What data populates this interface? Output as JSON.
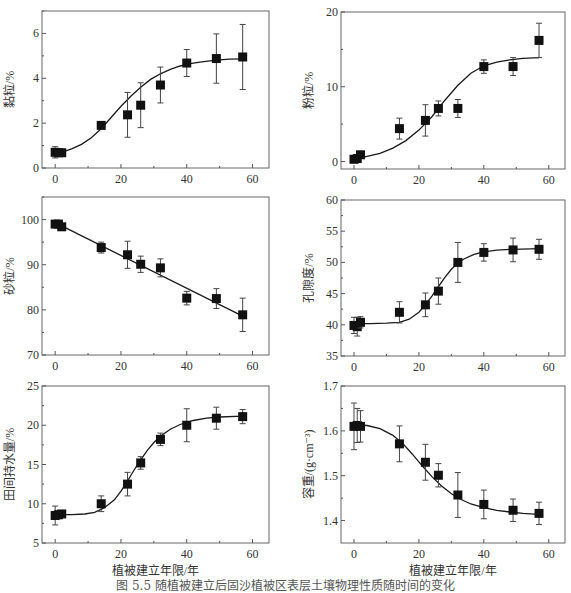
{
  "figure": {
    "caption": "图 5.5  随植被建立后固沙植被区表层土壤物理性质随时间的变化",
    "xlabel": "植被建立年限/年"
  },
  "chart_data": [
    {
      "id": "clay",
      "type": "scatter",
      "title": "",
      "xlabel": "",
      "ylabel": "黏粒/%",
      "xlim": [
        -4,
        65
      ],
      "ylim": [
        0,
        7
      ],
      "xticks": [
        0,
        20,
        40,
        60
      ],
      "yticks": [
        0,
        2,
        4,
        6
      ],
      "x": [
        0,
        1,
        2,
        14,
        22,
        26,
        32,
        40,
        49,
        57
      ],
      "y": [
        0.7,
        0.68,
        0.68,
        1.9,
        2.37,
        2.8,
        3.7,
        4.68,
        4.88,
        4.95
      ],
      "err": [
        0.25,
        0.15,
        0.1,
        0.05,
        1.0,
        1.0,
        0.8,
        0.6,
        1.1,
        1.45
      ],
      "fit": {
        "type": "sigmoid",
        "x": [
          2,
          5,
          8,
          11,
          14,
          17,
          20,
          23,
          26,
          29,
          32,
          35,
          38,
          41,
          44,
          47,
          50,
          53,
          57
        ],
        "y": [
          0.7,
          0.85,
          1.05,
          1.35,
          1.75,
          2.25,
          2.75,
          3.2,
          3.6,
          3.95,
          4.2,
          4.4,
          4.55,
          4.65,
          4.72,
          4.78,
          4.82,
          4.85,
          4.87
        ]
      },
      "box": {
        "left": 42,
        "top": 11,
        "right": 269,
        "bottom": 168
      }
    },
    {
      "id": "silt",
      "type": "scatter",
      "title": "",
      "xlabel": "",
      "ylabel": "粉粒/%",
      "xlim": [
        -4,
        65
      ],
      "ylim": [
        -1,
        20
      ],
      "xticks": [
        0,
        20,
        40,
        60
      ],
      "yticks": [
        0,
        10,
        20
      ],
      "x": [
        0,
        1,
        2,
        14,
        22,
        26,
        32,
        40,
        49,
        57
      ],
      "y": [
        0.3,
        0.4,
        0.9,
        4.4,
        5.5,
        7.1,
        7.1,
        12.7,
        12.7,
        16.2
      ],
      "err": [
        0.2,
        0.2,
        0.3,
        1.4,
        2.1,
        1.0,
        1.2,
        0.9,
        1.2,
        2.3
      ],
      "fit": {
        "type": "sigmoid",
        "x": [
          1,
          4,
          8,
          12,
          16,
          20,
          24,
          28,
          32,
          36,
          40,
          44,
          48,
          52,
          57
        ],
        "y": [
          0.4,
          0.7,
          1.1,
          1.8,
          2.8,
          4.2,
          6.0,
          8.2,
          10.2,
          11.8,
          12.8,
          13.3,
          13.6,
          13.8,
          13.9
        ]
      },
      "box": {
        "left": 341,
        "top": 12,
        "right": 565,
        "bottom": 169
      }
    },
    {
      "id": "sand",
      "type": "scatter",
      "title": "",
      "xlabel": "",
      "ylabel": "砂粒/%",
      "xlim": [
        -4,
        65
      ],
      "ylim": [
        70,
        105
      ],
      "xticks": [
        0,
        20,
        40,
        60
      ],
      "yticks": [
        70,
        80,
        90,
        100
      ],
      "x": [
        0,
        1,
        2,
        14,
        22,
        26,
        32,
        40,
        49,
        57
      ],
      "y": [
        99.0,
        99.0,
        98.4,
        93.8,
        92.2,
        90.1,
        89.3,
        82.6,
        82.5,
        78.9
      ],
      "err": [
        0.3,
        0.3,
        0.4,
        1.2,
        3.0,
        1.8,
        2.0,
        1.5,
        2.2,
        3.7
      ],
      "fit": {
        "type": "linear",
        "x": [
          2,
          57
        ],
        "y": [
          98.6,
          78.6
        ]
      },
      "box": {
        "left": 42,
        "top": 197,
        "right": 269,
        "bottom": 355
      }
    },
    {
      "id": "porosity",
      "type": "scatter",
      "title": "",
      "xlabel": "",
      "ylabel": "孔隙度/%",
      "xlim": [
        -4,
        65
      ],
      "ylim": [
        35,
        60
      ],
      "xticks": [
        0,
        20,
        40,
        60
      ],
      "yticks": [
        35,
        40,
        45,
        50,
        55,
        60
      ],
      "x": [
        0,
        1,
        2,
        14,
        22,
        26,
        32,
        40,
        49,
        57
      ],
      "y": [
        39.9,
        39.7,
        40.4,
        42.0,
        43.2,
        45.4,
        50.0,
        51.6,
        52.0,
        52.1
      ],
      "err": [
        1.3,
        1.5,
        0.9,
        1.7,
        1.9,
        2.1,
        3.2,
        1.4,
        1.9,
        1.6
      ],
      "fit": {
        "type": "sigmoid",
        "x": [
          1,
          5,
          10,
          14,
          17,
          20,
          22,
          24,
          26,
          28,
          30,
          32,
          34,
          37,
          40,
          44,
          49,
          57
        ],
        "y": [
          40.2,
          40.2,
          40.25,
          40.4,
          40.9,
          42.0,
          43.2,
          44.6,
          46.1,
          47.6,
          48.9,
          49.9,
          50.6,
          51.3,
          51.7,
          51.95,
          52.1,
          52.2
        ]
      },
      "box": {
        "left": 341,
        "top": 200,
        "right": 565,
        "bottom": 356
      }
    },
    {
      "id": "field-capacity",
      "type": "scatter",
      "title": "",
      "xlabel": "植被建立年限/年",
      "ylabel": "田间持水量/%",
      "xlim": [
        -4,
        65
      ],
      "ylim": [
        5,
        25
      ],
      "xticks": [
        0,
        20,
        40,
        60
      ],
      "yticks": [
        5,
        10,
        15,
        20,
        25
      ],
      "x": [
        0,
        1,
        2,
        14,
        22,
        26,
        32,
        40,
        49,
        57
      ],
      "y": [
        8.5,
        8.6,
        8.7,
        10.0,
        12.5,
        15.2,
        18.2,
        20.0,
        20.9,
        21.1
      ],
      "err": [
        1.2,
        0.5,
        0.4,
        1.0,
        1.5,
        0.8,
        0.8,
        2.1,
        1.4,
        0.9
      ],
      "fit": {
        "type": "sigmoid",
        "x": [
          1,
          5,
          9,
          12,
          15,
          18,
          20,
          22,
          24,
          26,
          28,
          30,
          32,
          35,
          38,
          42,
          46,
          50,
          57
        ],
        "y": [
          8.6,
          8.6,
          8.7,
          8.9,
          9.5,
          10.5,
          11.6,
          12.9,
          14.3,
          15.6,
          16.8,
          17.8,
          18.6,
          19.5,
          20.1,
          20.6,
          20.9,
          21.05,
          21.15
        ]
      },
      "box": {
        "left": 42,
        "top": 386,
        "right": 269,
        "bottom": 543
      }
    },
    {
      "id": "bulk-density",
      "type": "scatter",
      "title": "",
      "xlabel": "植被建立年限/年",
      "ylabel": "容重/(g·cm⁻³)",
      "xlim": [
        -4,
        65
      ],
      "ylim": [
        1.35,
        1.7
      ],
      "xticks": [
        0,
        20,
        40,
        60
      ],
      "yticks": [
        1.4,
        1.5,
        1.6,
        1.7
      ],
      "x": [
        0,
        1,
        2,
        14,
        22,
        26,
        32,
        40,
        49,
        57
      ],
      "y": [
        1.61,
        1.612,
        1.61,
        1.571,
        1.53,
        1.501,
        1.457,
        1.436,
        1.423,
        1.416
      ],
      "err": [
        0.052,
        0.038,
        0.035,
        0.04,
        0.04,
        0.026,
        0.05,
        0.032,
        0.025,
        0.025
      ],
      "fit": {
        "type": "sigmoid",
        "x": [
          1,
          4,
          8,
          12,
          15,
          18,
          21,
          24,
          27,
          30,
          33,
          36,
          40,
          44,
          48,
          52,
          57
        ],
        "y": [
          1.613,
          1.612,
          1.605,
          1.59,
          1.572,
          1.548,
          1.522,
          1.498,
          1.477,
          1.46,
          1.447,
          1.437,
          1.429,
          1.423,
          1.419,
          1.416,
          1.414
        ]
      },
      "box": {
        "left": 341,
        "top": 386,
        "right": 565,
        "bottom": 543
      }
    }
  ]
}
